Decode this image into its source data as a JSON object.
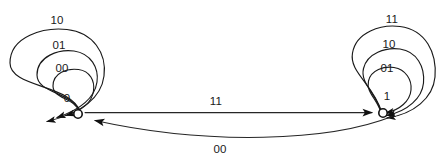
{
  "diagram": {
    "type": "finite-state-machine",
    "title": "",
    "states": [
      {
        "id": "s0",
        "label": "0",
        "cx": 78,
        "cy": 114,
        "r": 4.2
      },
      {
        "id": "s1",
        "label": "1",
        "cx": 383,
        "cy": 113,
        "r": 4.2
      }
    ],
    "self_loops_left": [
      {
        "label": "00",
        "label_x": 62,
        "label_y": 72,
        "size": "inner"
      },
      {
        "label": "01",
        "label_x": 59,
        "label_y": 49,
        "size": "middle"
      },
      {
        "label": "10",
        "label_x": 57,
        "label_y": 24,
        "size": "outer"
      }
    ],
    "self_loops_right": [
      {
        "label": "01",
        "label_x": 387,
        "label_y": 72,
        "size": "inner"
      },
      {
        "label": "10",
        "label_x": 389,
        "label_y": 48,
        "size": "middle"
      },
      {
        "label": "11",
        "label_x": 392,
        "label_y": 23,
        "size": "outer"
      }
    ],
    "transitions": [
      {
        "from": "0",
        "to": "1",
        "label": "11",
        "label_x": 216,
        "label_y": 105,
        "shape": "straight",
        "direction": "left-to-right"
      },
      {
        "from": "1",
        "to": "0",
        "label": "00",
        "label_x": 220,
        "label_y": 153,
        "shape": "curved",
        "direction": "right-to-left"
      }
    ],
    "colors": {
      "stroke": "#1a1a1a",
      "node_fill": "#ffffff",
      "node_stroke": "#111111",
      "background": "#ffffff",
      "text": "#1a1a1a"
    }
  }
}
